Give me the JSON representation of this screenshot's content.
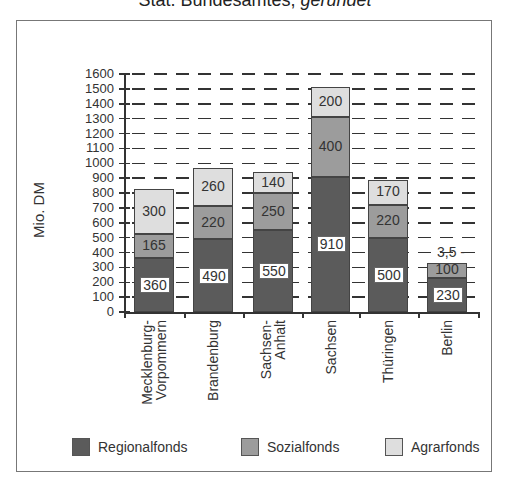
{
  "title": {
    "normal": "Stat. Bundesamtes, ",
    "italic": "gerundet"
  },
  "colors": {
    "Regionalfonds": "#5b5b5b",
    "Sozialfonds": "#9c9c9c",
    "Agrarfonds": "#dedede"
  },
  "chart_data": {
    "type": "bar",
    "stacked": true,
    "title": "Stat. Bundesamtes, gerundet",
    "xlabel": "",
    "ylabel": "Mio. DM",
    "ylim": [
      0,
      1600
    ],
    "yticks": [
      0,
      100,
      200,
      300,
      400,
      500,
      600,
      700,
      800,
      900,
      1000,
      1100,
      1200,
      1300,
      1400,
      1500,
      1600
    ],
    "grid": "dashed horizontal",
    "legend_position": "bottom",
    "categories": [
      "Mecklenburg-Vorpommern",
      "Brandenburg",
      "Sachsen-Anhalt",
      "Sachsen",
      "Thüringen",
      "Berlin"
    ],
    "category_labels": [
      [
        "Mecklenburg-",
        "Vorpommern"
      ],
      [
        "Brandenburg"
      ],
      [
        "Sachsen-",
        "Anhalt"
      ],
      [
        "Sachsen"
      ],
      [
        "Thüringen"
      ],
      [
        "Berlin"
      ]
    ],
    "series": [
      {
        "name": "Regionalfonds",
        "values": [
          360,
          490,
          550,
          910,
          500,
          230
        ]
      },
      {
        "name": "Sozialfonds",
        "values": [
          165,
          220,
          250,
          400,
          220,
          100
        ]
      },
      {
        "name": "Agrarfonds",
        "values": [
          300,
          260,
          140,
          200,
          170,
          3.5
        ]
      }
    ],
    "value_labels": [
      [
        "360",
        "490",
        "550",
        "910",
        "500",
        "230"
      ],
      [
        "165",
        "220",
        "250",
        "400",
        "220",
        "100"
      ],
      [
        "300",
        "260",
        "140",
        "200",
        "170",
        "3,5"
      ]
    ]
  },
  "legend": [
    {
      "label": "Regionalfonds"
    },
    {
      "label": "Sozialfonds"
    },
    {
      "label": "Agrarfonds"
    }
  ]
}
